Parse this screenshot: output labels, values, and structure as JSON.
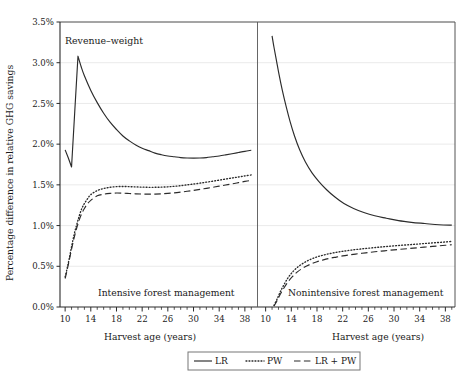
{
  "figure": {
    "corner_label": "Revenue–weight",
    "y_axis_title": "Percentage difference in relative GHG savings",
    "x_axis_title_left": "Harvest age (years)",
    "x_axis_title_right": "Harvest age (years)",
    "panel_label_left": "Intensive forest management",
    "panel_label_right": "Nonintensive forest management",
    "legend": {
      "items": [
        {
          "label": "LR",
          "style": "solid"
        },
        {
          "label": "PW",
          "style": "dotted"
        },
        {
          "label": "LR + PW",
          "style": "dashed"
        }
      ]
    },
    "colors": {
      "line": "#2b2b2b",
      "grid": "#e8e8e8",
      "frame": "#555555",
      "background": "#ffffff"
    }
  },
  "chart_data": {
    "type": "line",
    "title": "Revenue–weight",
    "xlabel": "Harvest age (years)",
    "ylabel": "Percentage difference in relative GHG savings",
    "ylim": [
      0.0,
      3.5
    ],
    "y_ticks": [
      0.0,
      0.5,
      1.0,
      1.5,
      2.0,
      2.5,
      3.0,
      3.5
    ],
    "y_tick_labels": [
      "0.0%",
      "0.5%",
      "1.0%",
      "1.5%",
      "2.0%",
      "2.5%",
      "3.0%",
      "3.5%"
    ],
    "grid": true,
    "legend_position": "below",
    "panels": [
      {
        "name": "Intensive forest management",
        "xlim": [
          9.2,
          39.5
        ],
        "x_ticks": [
          10,
          14,
          18,
          22,
          26,
          30,
          34,
          38
        ],
        "x_tick_labels": [
          "10",
          "14",
          "18",
          "22",
          "26",
          "30",
          "34",
          "38"
        ],
        "x_minor_tick_step": 1,
        "series": [
          {
            "name": "LR",
            "style": "solid",
            "x": [
              10,
              10.5,
              11,
              11.5,
              12,
              12.5,
              13,
              14,
              15,
              16,
              17,
              18,
              19,
              20,
              21,
              22,
              23,
              24,
              25,
              26,
              27,
              28,
              29,
              30,
              31,
              32,
              33,
              34,
              35,
              36,
              37,
              38,
              39
            ],
            "y": [
              1.93,
              1.83,
              1.72,
              2.4,
              3.08,
              2.95,
              2.84,
              2.66,
              2.51,
              2.38,
              2.27,
              2.18,
              2.1,
              2.04,
              1.99,
              1.95,
              1.92,
              1.89,
              1.87,
              1.855,
              1.845,
              1.835,
              1.83,
              1.828,
              1.83,
              1.835,
              1.845,
              1.855,
              1.868,
              1.882,
              1.897,
              1.912,
              1.925
            ]
          },
          {
            "name": "PW",
            "style": "dotted",
            "x": [
              10,
              10.3,
              10.6,
              11,
              11.4,
              11.8,
              12.2,
              12.6,
              13,
              13.5,
              14,
              15,
              16,
              17,
              18,
              19,
              20,
              21,
              22,
              23,
              24,
              25,
              26,
              27,
              28,
              29,
              30,
              31,
              32,
              33,
              34,
              35,
              36,
              37,
              38,
              39
            ],
            "y": [
              0.37,
              0.47,
              0.58,
              0.74,
              0.89,
              1.01,
              1.12,
              1.21,
              1.27,
              1.33,
              1.38,
              1.43,
              1.455,
              1.47,
              1.478,
              1.48,
              1.478,
              1.475,
              1.472,
              1.47,
              1.47,
              1.472,
              1.476,
              1.482,
              1.49,
              1.5,
              1.51,
              1.521,
              1.533,
              1.545,
              1.558,
              1.571,
              1.584,
              1.597,
              1.61,
              1.622
            ]
          },
          {
            "name": "LR + PW",
            "style": "dashed",
            "x": [
              10,
              10.3,
              10.6,
              11,
              11.4,
              11.8,
              12.2,
              12.6,
              13,
              13.5,
              14,
              15,
              16,
              17,
              18,
              19,
              20,
              21,
              22,
              23,
              24,
              25,
              26,
              27,
              28,
              29,
              30,
              31,
              32,
              33,
              34,
              35,
              36,
              37,
              38,
              39
            ],
            "y": [
              0.35,
              0.45,
              0.56,
              0.71,
              0.85,
              0.97,
              1.07,
              1.15,
              1.21,
              1.27,
              1.31,
              1.365,
              1.385,
              1.395,
              1.4,
              1.398,
              1.394,
              1.39,
              1.387,
              1.386,
              1.387,
              1.39,
              1.395,
              1.402,
              1.411,
              1.421,
              1.432,
              1.444,
              1.457,
              1.47,
              1.484,
              1.498,
              1.512,
              1.527,
              1.542,
              1.556
            ]
          }
        ]
      },
      {
        "name": "Nonintensive forest management",
        "xlim": [
          9.2,
          39.5
        ],
        "x_ticks": [
          10,
          14,
          18,
          22,
          26,
          30,
          34,
          38
        ],
        "x_tick_labels": [
          "10",
          "14",
          "18",
          "22",
          "26",
          "30",
          "34",
          "38"
        ],
        "x_minor_tick_step": 1,
        "series": [
          {
            "name": "LR",
            "style": "solid",
            "x": [
              11.0,
              11.3,
              11.7,
              12.1,
              12.6,
              13.2,
              13.8,
              14.5,
              15.3,
              16.2,
              17.2,
              18.3,
              19.5,
              20.8,
              22.2,
              23.7,
              25.3,
              27.0,
              28.8,
              30.7,
              32.7,
              34.8,
              37.0,
              39.0
            ],
            "y": [
              3.33,
              3.19,
              3.02,
              2.85,
              2.66,
              2.46,
              2.28,
              2.1,
              1.93,
              1.78,
              1.65,
              1.54,
              1.44,
              1.35,
              1.27,
              1.21,
              1.16,
              1.12,
              1.09,
              1.06,
              1.04,
              1.025,
              1.01,
              1.005
            ]
          },
          {
            "name": "PW",
            "style": "dotted",
            "x": [
              11.3,
              11.8,
              12.3,
              12.9,
              13.5,
              14.2,
              15,
              16,
              17,
              18,
              19,
              20,
              21,
              22,
              23,
              24,
              25,
              26,
              27,
              28,
              29,
              30,
              31,
              32,
              33,
              34,
              35,
              36,
              37,
              38,
              39
            ],
            "y": [
              0.02,
              0.1,
              0.19,
              0.28,
              0.36,
              0.43,
              0.49,
              0.545,
              0.585,
              0.615,
              0.638,
              0.656,
              0.671,
              0.684,
              0.695,
              0.705,
              0.714,
              0.722,
              0.73,
              0.737,
              0.744,
              0.751,
              0.757,
              0.763,
              0.769,
              0.775,
              0.781,
              0.787,
              0.793,
              0.799,
              0.805
            ]
          },
          {
            "name": "LR + PW",
            "style": "dashed",
            "x": [
              11.3,
              11.8,
              12.3,
              12.9,
              13.5,
              14.2,
              15,
              16,
              17,
              18,
              19,
              20,
              21,
              22,
              23,
              24,
              25,
              26,
              27,
              28,
              29,
              30,
              31,
              32,
              33,
              34,
              35,
              36,
              37,
              38,
              39
            ],
            "y": [
              0.01,
              0.08,
              0.16,
              0.24,
              0.31,
              0.375,
              0.435,
              0.487,
              0.526,
              0.556,
              0.579,
              0.598,
              0.613,
              0.627,
              0.639,
              0.65,
              0.66,
              0.669,
              0.678,
              0.686,
              0.694,
              0.702,
              0.709,
              0.716,
              0.723,
              0.73,
              0.737,
              0.744,
              0.751,
              0.758,
              0.765
            ]
          }
        ]
      }
    ]
  }
}
